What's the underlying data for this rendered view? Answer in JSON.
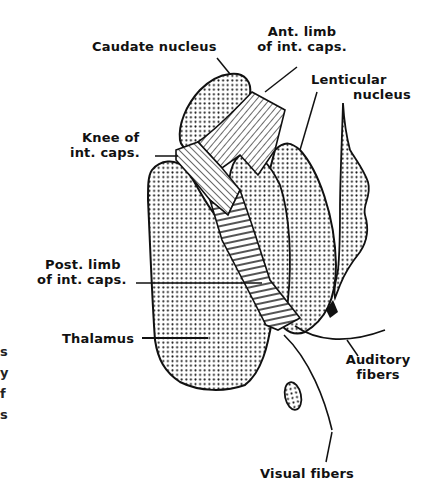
{
  "figure": {
    "type": "anatomical-diagram",
    "background": "#ffffff",
    "ink_color": "#111111",
    "labels": {
      "caudate": "Caudate nucleus",
      "ant_limb_1": "Ant. limb",
      "ant_limb_2": "of int. caps.",
      "lenticular_1": "Lenticular",
      "lenticular_2": "nucleus",
      "knee_1": "Knee of",
      "knee_2": "int. caps.",
      "post_limb_1": "Post. limb",
      "post_limb_2": "of int. caps.",
      "thalamus": "Thalamus",
      "auditory_1": "Auditory",
      "auditory_2": "fibers",
      "visual": "Visual fibers"
    },
    "margin_fragments": [
      "s",
      "y",
      "f",
      "s"
    ],
    "structures": [
      {
        "name": "Caudate nucleus",
        "fill": "stippled"
      },
      {
        "name": "Anterior limb of internal capsule",
        "fill": "diagonal-hatch"
      },
      {
        "name": "Knee of internal capsule",
        "fill": "diagonal-hatch"
      },
      {
        "name": "Posterior limb of internal capsule",
        "fill": "horizontal-hatch"
      },
      {
        "name": "Lenticular nucleus (putamen)",
        "fill": "stippled"
      },
      {
        "name": "Lenticular nucleus (globus pallidus)",
        "fill": "stippled"
      },
      {
        "name": "Claustrum",
        "fill": "stippled"
      },
      {
        "name": "Thalamus",
        "fill": "stippled"
      },
      {
        "name": "Lateral geniculate / small nucleus",
        "fill": "stippled"
      }
    ]
  }
}
